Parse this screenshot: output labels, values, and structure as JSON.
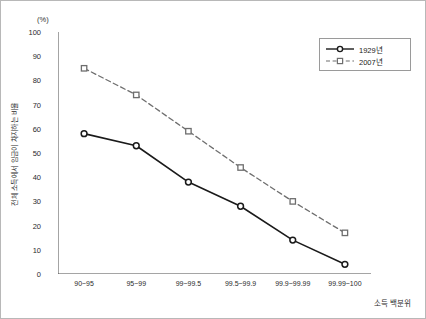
{
  "chart_data": {
    "type": "line",
    "title": "",
    "subtitle": "",
    "unit_label": "(%)",
    "xlabel": "소득 백분위",
    "ylabel": "전체 소득에서 임금이 차지하는 비율",
    "categories": [
      "90~95",
      "95~99",
      "99~99.5",
      "99.5~99.9",
      "99.9~99.99",
      "99.99~100"
    ],
    "ylim": [
      0,
      100
    ],
    "yticks": [
      0,
      10,
      20,
      30,
      40,
      50,
      60,
      70,
      80,
      90,
      100
    ],
    "grid": false,
    "legend_position": "top-right",
    "series": [
      {
        "name": "1929년",
        "values": [
          58,
          53,
          38,
          28,
          14,
          4
        ],
        "color": "#1a1a1a",
        "line_style": "solid",
        "marker": "circle"
      },
      {
        "name": "2007년",
        "values": [
          85,
          74,
          59,
          44,
          30,
          17
        ],
        "color": "#6e6e6e",
        "line_style": "dashed",
        "marker": "square"
      }
    ]
  },
  "legend": {
    "items": [
      {
        "label": "1929년"
      },
      {
        "label": "2007년"
      }
    ]
  },
  "colors": {
    "series_1929": "#1a1a1a",
    "series_2007": "#6e6e6e",
    "axis": "#4a4a4a",
    "frame": "#b8b8b8"
  }
}
